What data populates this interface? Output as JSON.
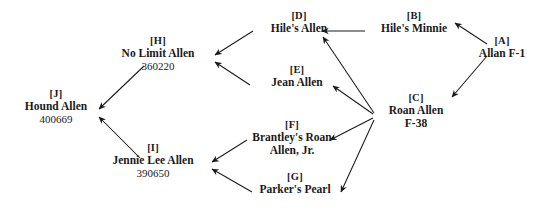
{
  "diagram": {
    "background_color": "#ffffff",
    "line_color": "#1a1a1a",
    "text_color": "#1a1a1a"
  },
  "nodes": {
    "a": {
      "tag": "[A]",
      "name": "Allan F-1",
      "name2": "",
      "reg": ""
    },
    "b": {
      "tag": "[B]",
      "name": "Hile's Minnie",
      "name2": "",
      "reg": ""
    },
    "c": {
      "tag": "[C]",
      "name": "Roan Allen",
      "name2": "F-38",
      "reg": ""
    },
    "d": {
      "tag": "[D]",
      "name": "Hile's Allen",
      "name2": "",
      "reg": ""
    },
    "e": {
      "tag": "[E]",
      "name": "Jean Allen",
      "name2": "",
      "reg": ""
    },
    "f": {
      "tag": "[F]",
      "name": "Brantley's Roan",
      "name2": "Allen, Jr.",
      "reg": ""
    },
    "g": {
      "tag": "[G]",
      "name": "Parker's Pearl",
      "name2": "",
      "reg": ""
    },
    "h": {
      "tag": "[H]",
      "name": "No Limit Allen",
      "name2": "",
      "reg": "360220"
    },
    "i": {
      "tag": "[I]",
      "name": "Jennie Lee Allen",
      "name2": "",
      "reg": "390650"
    },
    "j": {
      "tag": "[J]",
      "name": "Hound Allen",
      "name2": "",
      "reg": "400669"
    }
  },
  "edges": [
    {
      "id": "a-to-b",
      "from": "a",
      "to": "b"
    },
    {
      "id": "a-to-c",
      "from": "a",
      "to": "c"
    },
    {
      "id": "b-to-d",
      "from": "b",
      "to": "d"
    },
    {
      "id": "c-to-d",
      "from": "c",
      "to": "d"
    },
    {
      "id": "c-to-e",
      "from": "c",
      "to": "e"
    },
    {
      "id": "c-to-f",
      "from": "c",
      "to": "f"
    },
    {
      "id": "c-to-g",
      "from": "c",
      "to": "g"
    },
    {
      "id": "d-to-h",
      "from": "d",
      "to": "h"
    },
    {
      "id": "e-to-h",
      "from": "e",
      "to": "h"
    },
    {
      "id": "f-to-i",
      "from": "f",
      "to": "i"
    },
    {
      "id": "g-to-i",
      "from": "g",
      "to": "i"
    },
    {
      "id": "h-to-j",
      "from": "h",
      "to": "j"
    },
    {
      "id": "i-to-j",
      "from": "i",
      "to": "j"
    }
  ]
}
